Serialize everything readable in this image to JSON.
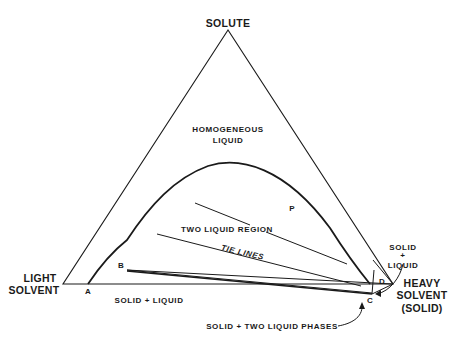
{
  "diagram": {
    "type": "ternary-phase-diagram",
    "vertices": {
      "top": "SOLUTE",
      "left_line1": "LIGHT",
      "left_line2": "SOLVENT",
      "right_line1": "HEAVY",
      "right_line2": "SOLVENT",
      "right_line3": "(SOLID)"
    },
    "regions": {
      "homogeneous_line1": "HOMOGENEOUS",
      "homogeneous_line2": "LIQUID",
      "two_liquid": "TWO LIQUID REGION",
      "solid_liquid_left": "SOLID + LIQUID",
      "solid_liquid_right_line1": "SOLID",
      "solid_liquid_right_line2": "+",
      "solid_liquid_right_line3": "LIQUID",
      "solid_two_liquid": "SOLID + TWO LIQUID PHASES"
    },
    "annotations": {
      "tie_lines": "TIE LINES"
    },
    "points": {
      "A": "A",
      "B": "B",
      "C": "C",
      "D": "D",
      "P": "P"
    },
    "colors": {
      "ink": "#1a1a1a",
      "background": "#ffffff"
    }
  }
}
